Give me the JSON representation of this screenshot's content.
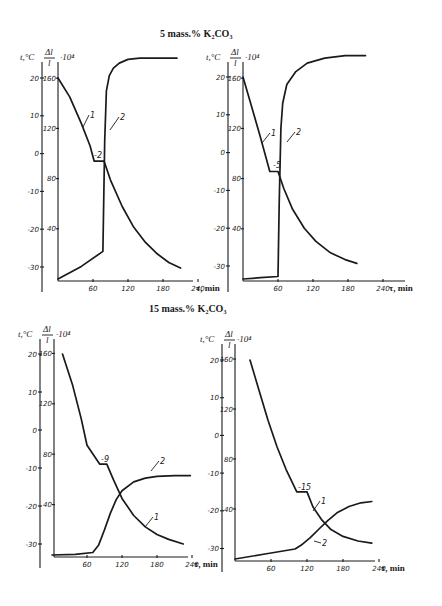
{
  "figure": {
    "sections": [
      {
        "title": "5 mass.% K₂CO₃"
      },
      {
        "title": "15 mass.% K₂CO₃"
      }
    ]
  },
  "axes": {
    "t_label": "t,°C",
    "dl_label_num": "Δl",
    "dl_label_den": "l",
    "dl_label_scale": "·10⁴",
    "x_label": "τ, min",
    "t_ticks": [
      20,
      10,
      0,
      -10,
      -20,
      -30
    ],
    "dl_ticks": [
      160,
      120,
      80,
      40
    ],
    "x_ticks": [
      60,
      120,
      180,
      240
    ]
  },
  "chart_data": [
    {
      "type": "line",
      "title": "5 mass.% K₂CO₃ (left)",
      "xlabel": "τ, min",
      "ylabel_left": "t, °C",
      "ylabel_right": "Δl/l · 10⁴",
      "xlim": [
        0,
        250
      ],
      "ylim_t": [
        -33,
        22
      ],
      "ylim_dl": [
        0,
        180
      ],
      "grid": false,
      "annotations": [
        "-2"
      ],
      "series": [
        {
          "name": "1",
          "axis": "t",
          "x": [
            0,
            20,
            40,
            55,
            62,
            79,
            90,
            110,
            130,
            150,
            170,
            190,
            210
          ],
          "values": [
            20,
            15,
            8,
            2,
            -2,
            -2,
            -7,
            -14,
            -19.5,
            -23.5,
            -26.5,
            -28.8,
            -30.3
          ]
        },
        {
          "name": "2",
          "axis": "dl",
          "x": [
            0,
            40,
            77,
            80,
            83,
            88,
            95,
            105,
            120,
            140,
            170,
            204
          ],
          "values": [
            0,
            10,
            22,
            110,
            150,
            162,
            168,
            172,
            175,
            176,
            176,
            176
          ]
        }
      ]
    },
    {
      "type": "line",
      "title": "5 mass.% K₂CO₃ (right)",
      "xlabel": "τ, min",
      "ylabel_left": "t, °C",
      "ylabel_right": "Δl/l · 10⁴",
      "xlim": [
        0,
        250
      ],
      "ylim_t": [
        -33,
        22
      ],
      "ylim_dl": [
        0,
        180
      ],
      "grid": false,
      "annotations": [
        "-5"
      ],
      "series": [
        {
          "name": "1",
          "axis": "t",
          "x": [
            0,
            15,
            30,
            46,
            60,
            70,
            85,
            105,
            125,
            150,
            175,
            195
          ],
          "values": [
            20,
            12,
            4,
            -5,
            -5,
            -9.5,
            -15,
            -20,
            -23.5,
            -26.5,
            -28.3,
            -29.3
          ]
        },
        {
          "name": "2",
          "axis": "dl",
          "x": [
            0,
            30,
            60,
            62,
            65,
            68,
            75,
            90,
            110,
            140,
            175,
            210
          ],
          "values": [
            0,
            1,
            2,
            60,
            120,
            140,
            155,
            165,
            172,
            176,
            178,
            178
          ]
        }
      ]
    },
    {
      "type": "line",
      "title": "15 mass.% K₂CO₃ (left)",
      "xlabel": "τ, min",
      "ylabel_left": "t, °C",
      "ylabel_right": "Δl/l · 10⁴",
      "xlim": [
        0,
        250
      ],
      "ylim_t": [
        -33,
        22
      ],
      "ylim_dl": [
        0,
        180
      ],
      "grid": false,
      "annotations": [
        "-9"
      ],
      "series": [
        {
          "name": "1",
          "axis": "t",
          "x": [
            18,
            35,
            50,
            60,
            82,
            94,
            105,
            120,
            140,
            160,
            180,
            200,
            225
          ],
          "values": [
            20,
            12,
            3,
            -4,
            -9,
            -9,
            -13,
            -18,
            -22.5,
            -25.5,
            -27.5,
            -28.8,
            -30
          ]
        },
        {
          "name": "2",
          "axis": "dl",
          "x": [
            0,
            40,
            70,
            80,
            90,
            100,
            110,
            120,
            140,
            160,
            180,
            210,
            237
          ],
          "values": [
            0,
            0.5,
            2,
            8,
            20,
            33,
            44,
            51,
            58,
            61,
            62.5,
            63,
            63
          ]
        }
      ]
    },
    {
      "type": "line",
      "title": "15 mass.% K₂CO₃ (right)",
      "xlabel": "τ, min",
      "ylabel_left": "t, °C",
      "ylabel_right": "Δl/l · 10⁴",
      "xlim": [
        0,
        250
      ],
      "ylim_t": [
        -33,
        22
      ],
      "ylim_dl": [
        0,
        180
      ],
      "grid": false,
      "annotations": [
        "-15"
      ],
      "series": [
        {
          "name": "1",
          "axis": "t",
          "x": [
            25,
            40,
            55,
            70,
            85,
            103,
            120,
            130,
            145,
            160,
            180,
            205,
            228
          ],
          "values": [
            20,
            12,
            4,
            -3,
            -9,
            -15,
            -15,
            -19,
            -22.5,
            -25,
            -26.8,
            -28,
            -28.6
          ]
        },
        {
          "name": "2",
          "axis": "dl",
          "x": [
            0,
            50,
            100,
            110,
            125,
            140,
            155,
            170,
            190,
            210,
            228
          ],
          "values": [
            0,
            4,
            8,
            11,
            17,
            24,
            31,
            37,
            42,
            45,
            46
          ]
        }
      ]
    }
  ]
}
